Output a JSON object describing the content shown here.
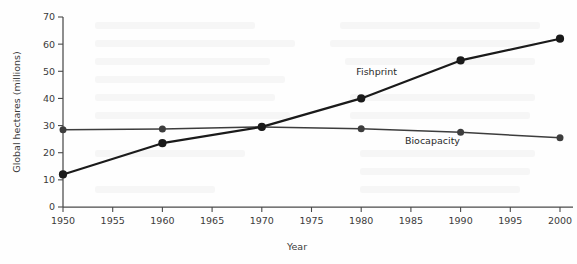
{
  "chart_data": {
    "type": "line",
    "title": "",
    "xlabel": "Year",
    "ylabel": "Global hectares (millions)",
    "x": [
      1950,
      1960,
      1970,
      1980,
      1990,
      2000
    ],
    "xlim": [
      1950,
      2000
    ],
    "ylim": [
      0,
      70
    ],
    "xticks": [
      1950,
      1955,
      1960,
      1965,
      1970,
      1975,
      1980,
      1985,
      1990,
      1995,
      2000
    ],
    "xtick_labels": [
      "1950",
      "1955",
      "1960",
      "1965",
      "1970",
      "1975",
      "1980",
      "1985",
      "1990",
      "1995",
      "2000"
    ],
    "yticks": [
      0,
      10,
      20,
      30,
      40,
      50,
      60,
      70
    ],
    "ytick_labels": [
      "0",
      "10",
      "20",
      "30",
      "40",
      "50",
      "60",
      "70"
    ],
    "grid": false,
    "legend_position": "inline-annotation",
    "series": [
      {
        "name": "Fishprint",
        "values": [
          12,
          23.5,
          29.5,
          40,
          54,
          62
        ],
        "color": "#1a1a1a",
        "label_x": 1983.6,
        "label_y": 48.5,
        "label_anchor": "end"
      },
      {
        "name": "Biocapacity",
        "values": [
          28.5,
          28.7,
          29.5,
          28.8,
          27.5,
          25.5
        ],
        "color": "#3d3d3d",
        "label_x": 1984.4,
        "label_y": 23.2,
        "label_anchor": "start"
      }
    ]
  }
}
